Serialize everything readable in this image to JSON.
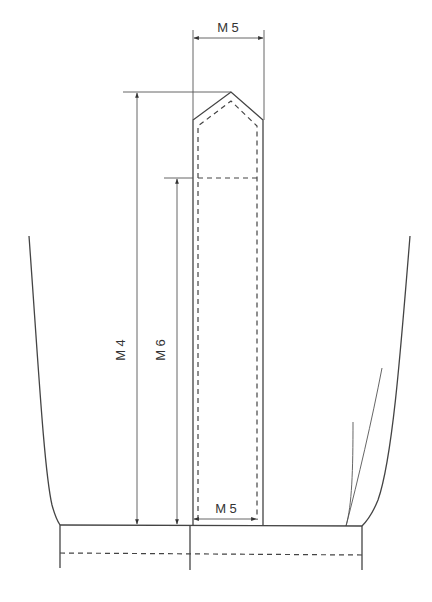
{
  "diagram": {
    "type": "technical pattern drawing",
    "stroke_color": "#444444",
    "background": "#ffffff",
    "labels": {
      "top_width": "M 5",
      "bottom_width": "M 5",
      "total_height": "M 4",
      "body_height": "M 6"
    },
    "dimensions": [
      {
        "id": "top_width",
        "label": "M 5",
        "orientation": "horizontal",
        "position": "top"
      },
      {
        "id": "bottom_width",
        "label": "M 5",
        "orientation": "horizontal",
        "position": "bottom"
      },
      {
        "id": "total_height",
        "label": "M 4",
        "orientation": "vertical",
        "position": "left-outer"
      },
      {
        "id": "body_height",
        "label": "M 6",
        "orientation": "vertical",
        "position": "left-inner"
      }
    ],
    "parts": [
      "pointed strip with dashed seam allowance",
      "curved left side panel",
      "curved right side panel with fold lines",
      "bottom band with dashed stitch line"
    ]
  }
}
